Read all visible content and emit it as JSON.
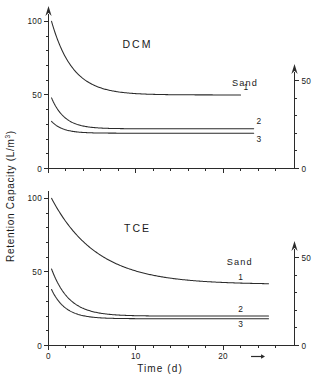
{
  "figure": {
    "y_axis_label_main": "Retention Capacity  (L/m",
    "y_axis_label_sup": "3",
    "y_axis_label_tail": ")",
    "x_axis_label": "Time  (d)"
  },
  "panels": [
    {
      "id": "dcm",
      "label": "DCM",
      "legend_title": "Sand",
      "left_axis": {
        "min": 0,
        "max": 105,
        "ticks": [
          0,
          50,
          100
        ],
        "tick_labels": [
          "0",
          "50",
          "100"
        ],
        "minor_step": 10,
        "arrow": true
      },
      "right_axis": {
        "min": 0,
        "max": 55,
        "ticks": [
          0,
          50
        ],
        "tick_labels": [
          "0",
          "50"
        ],
        "minor_step": 10,
        "arrow": true
      },
      "x_axis": {
        "min": 0,
        "max": 26,
        "ticks": [
          0,
          10,
          20
        ],
        "tick_labels": [
          "",
          "",
          ""
        ],
        "minor_step": 2,
        "show_labels": false
      },
      "curves": [
        {
          "name": "1",
          "y0": 100.0,
          "yinf": 50.0,
          "tau": 2.4,
          "x_start": 0.35,
          "x_end": 22.0,
          "label_x": 22.6,
          "label_y_offset": -4.5
        },
        {
          "name": "2",
          "y0": 48.0,
          "yinf": 27.0,
          "tau": 1.5,
          "x_start": 0.35,
          "x_end": 23.5,
          "label_x": 24.1,
          "label_y_offset": -4.5
        },
        {
          "name": "3",
          "y0": 32.0,
          "yinf": 24.0,
          "tau": 1.3,
          "x_start": 0.35,
          "x_end": 23.5,
          "label_x": 24.1,
          "label_y_offset": 8.5
        }
      ]
    },
    {
      "id": "tce",
      "label": "TCE",
      "legend_title": "Sand",
      "left_axis": {
        "min": 0,
        "max": 105,
        "ticks": [
          0,
          50,
          100
        ],
        "tick_labels": [
          "0",
          "50",
          "100"
        ],
        "minor_step": 10,
        "arrow": false
      },
      "right_axis": {
        "min": 0,
        "max": 55,
        "ticks": [
          0,
          50
        ],
        "tick_labels": [
          "0",
          "50"
        ],
        "minor_step": 10,
        "arrow": true
      },
      "x_axis": {
        "min": 0,
        "max": 26,
        "ticks": [
          0,
          10,
          20
        ],
        "tick_labels": [
          "0",
          "10",
          "20"
        ],
        "minor_step": 2,
        "show_labels": true,
        "marker_arrow_x": 24.0
      },
      "curves": [
        {
          "name": "1",
          "y0": 100.0,
          "yinf": 41.5,
          "tau": 5.2,
          "x_start": 0.35,
          "x_end": 25.2,
          "label_x": 22.0,
          "label_y_offset": -4.5
        },
        {
          "name": "2",
          "y0": 52.0,
          "yinf": 20.0,
          "tau": 2.0,
          "x_start": 0.35,
          "x_end": 25.2,
          "label_x": 22.0,
          "label_y_offset": -4.5
        },
        {
          "name": "3",
          "y0": 38.0,
          "yinf": 18.2,
          "tau": 1.6,
          "x_start": 0.35,
          "x_end": 25.2,
          "label_x": 22.0,
          "label_y_offset": 8.5
        }
      ]
    }
  ],
  "chart_data": {
    "type": "line",
    "title": "",
    "xlabel": "Time (d)",
    "ylabel": "Retention Capacity (L/m3)",
    "xlim": [
      0,
      26
    ],
    "ylim": [
      0,
      105
    ],
    "grid": false,
    "legend_position": "inside-right",
    "panels": [
      {
        "panel_label": "DCM",
        "legend_title": "Sand",
        "x": [
          0.35,
          0.5,
          1,
          1.5,
          2,
          3,
          4,
          5,
          6,
          8,
          10,
          12,
          14,
          16,
          18,
          20,
          22,
          24
        ],
        "series": [
          {
            "name": "1",
            "values": [
              100.0,
              93.5,
              83.1,
              74.1,
              67.3,
              57.7,
              53.6,
              51.9,
              51.0,
              50.3,
              50.1,
              50.0,
              50.0,
              50.0,
              50.0,
              50.0,
              50.0,
              50.0
            ]
          },
          {
            "name": "2",
            "values": [
              48.0,
              45.2,
              38.1,
              33.4,
              30.6,
              28.0,
              27.3,
              27.1,
              27.0,
              27.0,
              27.0,
              27.0,
              27.0,
              27.0,
              27.0,
              27.0,
              27.0,
              27.0
            ]
          },
          {
            "name": "3",
            "values": [
              32.0,
              30.9,
              28.3,
              26.6,
              25.6,
              24.6,
              24.2,
              24.1,
              24.0,
              24.0,
              24.0,
              24.0,
              24.0,
              24.0,
              24.0,
              24.0,
              24.0,
              24.0
            ]
          }
        ],
        "left_axis_ticks": [
          0,
          50,
          100
        ],
        "right_axis_ticks": [
          0,
          50
        ],
        "x_ticks": [
          0,
          10,
          20
        ]
      },
      {
        "panel_label": "TCE",
        "legend_title": "Sand",
        "x": [
          0.35,
          0.5,
          1,
          1.5,
          2,
          3,
          4,
          5,
          6,
          8,
          10,
          12,
          14,
          16,
          18,
          20,
          22,
          24,
          25.2
        ],
        "series": [
          {
            "name": "1",
            "values": [
              100.0,
              95.0,
              89.0,
              83.6,
              78.8,
              70.5,
              63.8,
              58.4,
              54.1,
              47.9,
              44.3,
              42.6,
              42.0,
              41.7,
              41.6,
              41.5,
              41.5,
              41.5,
              41.5
            ]
          },
          {
            "name": "2",
            "values": [
              52.0,
              48.6,
              39.4,
              33.5,
              29.8,
              25.4,
              22.9,
              21.6,
              20.9,
              20.3,
              20.1,
              20.0,
              20.0,
              20.0,
              20.0,
              20.0,
              20.0,
              20.0,
              20.0
            ]
          },
          {
            "name": "3",
            "values": [
              38.0,
              35.5,
              29.4,
              25.6,
              23.4,
              20.7,
              19.4,
              18.9,
              18.6,
              18.3,
              18.2,
              18.2,
              18.2,
              18.2,
              18.2,
              18.2,
              18.2,
              18.2,
              18.2
            ]
          }
        ],
        "left_axis_ticks": [
          0,
          50,
          100
        ],
        "right_axis_ticks": [
          0,
          50
        ],
        "x_ticks": [
          0,
          10,
          20
        ]
      }
    ]
  }
}
